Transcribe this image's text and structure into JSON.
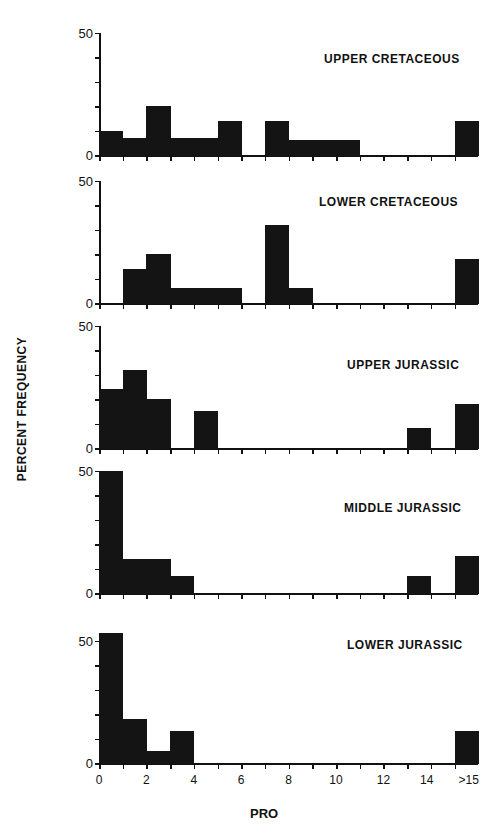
{
  "chart_data": {
    "type": "bar",
    "subtype": "stacked-panel histograms",
    "xlabel": "PRO",
    "ylabel": "PERCENT FREQUENCY",
    "x_tick_labels": [
      "0",
      "2",
      "4",
      "6",
      "8",
      "10",
      "12",
      "14",
      ">15"
    ],
    "bins": [
      "0-1",
      "1-2",
      "2-3",
      "3-4",
      "4-5",
      "5-6",
      "6-7",
      "7-8",
      "8-9",
      "9-10",
      "10-11",
      "11-12",
      "12-13",
      "13-14",
      "14-15",
      ">15"
    ],
    "ylim": [
      0,
      50
    ],
    "y_tick_labels": [
      "0",
      "50"
    ],
    "panels": [
      {
        "title": "UPPER CRETACEOUS",
        "values": [
          10,
          7,
          20,
          7,
          7,
          14,
          0,
          14,
          6,
          6,
          6,
          0,
          0,
          0,
          0,
          14
        ]
      },
      {
        "title": "LOWER CRETACEOUS",
        "values": [
          0,
          14,
          20,
          6,
          6,
          6,
          0,
          32,
          6,
          0,
          0,
          0,
          0,
          0,
          0,
          18
        ]
      },
      {
        "title": "UPPER JURASSIC",
        "values": [
          24,
          32,
          20,
          0,
          15,
          0,
          0,
          0,
          0,
          0,
          0,
          0,
          0,
          8,
          0,
          18
        ]
      },
      {
        "title": "MIDDLE JURASSIC",
        "values": [
          50,
          14,
          14,
          7,
          0,
          0,
          0,
          0,
          0,
          0,
          0,
          0,
          0,
          7,
          0,
          15
        ]
      },
      {
        "title": "LOWER JURASSIC",
        "values": [
          53,
          18,
          5,
          13,
          0,
          0,
          0,
          0,
          0,
          0,
          0,
          0,
          0,
          0,
          0,
          13
        ]
      }
    ]
  },
  "layout": {
    "x0": 99,
    "unit": 23.7,
    "px_per_10pct": 24.5,
    "baselines": [
      155,
      303,
      448,
      593,
      763
    ],
    "title_pos": [
      [
        324,
        52
      ],
      [
        319,
        195
      ],
      [
        347,
        358
      ],
      [
        344,
        501
      ],
      [
        347,
        638
      ]
    ],
    "bar_color": "#141414"
  }
}
